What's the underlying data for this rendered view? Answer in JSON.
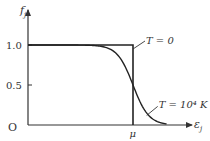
{
  "chart_data": {
    "type": "line",
    "title": "",
    "xlabel": "ε_j",
    "ylabel": "f_j",
    "origin_label": "O",
    "xlim": [
      0,
      1.6
    ],
    "ylim": [
      0,
      1.0
    ],
    "grid": false,
    "x_ticks": [
      {
        "value": 1.0,
        "label": "μ"
      }
    ],
    "y_ticks": [
      {
        "value": 1.0,
        "label": "1.0"
      },
      {
        "value": 0.5,
        "label": "0.5"
      }
    ],
    "mu": 1.0,
    "series": [
      {
        "name": "T=0",
        "label": "T = 0",
        "kind": "step",
        "points": [
          [
            0,
            1.0
          ],
          [
            1.0,
            1.0
          ],
          [
            1.0,
            0.0
          ]
        ]
      },
      {
        "name": "T=10^4 K",
        "label": "T = 10⁴ K",
        "kind": "fermi-dirac",
        "kT_over_mu": 0.075,
        "x_range": [
          0,
          1.32
        ]
      }
    ],
    "annotations": [
      {
        "text": "T = 0",
        "points_to_series": "T=0",
        "at_y": 0.95
      },
      {
        "text": "T = 10⁴ K",
        "points_to_series": "T=10^4 K",
        "at_y": 0.12
      }
    ]
  }
}
